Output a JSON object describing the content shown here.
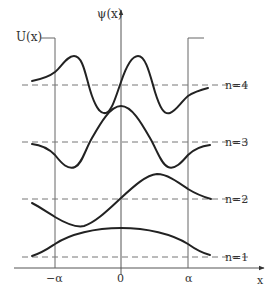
{
  "diagram": {
    "labels": {
      "potential": "U(x)",
      "wavefunction": "ψ(x)",
      "x_axis": "x",
      "tick_left": "−α",
      "tick_center": "0",
      "tick_right": "α"
    },
    "levels": [
      {
        "n": 1,
        "label": "n=1"
      },
      {
        "n": 2,
        "label": "n=2"
      },
      {
        "n": 3,
        "label": "n=3"
      },
      {
        "n": 4,
        "label": "n=4"
      }
    ],
    "colors": {
      "curve": "#222222",
      "axis": "#555555",
      "dashed": "#777777",
      "text": "#333333"
    }
  }
}
